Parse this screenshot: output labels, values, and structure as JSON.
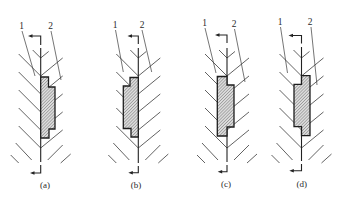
{
  "figures": [
    {
      "id": "a",
      "caption": "(a)",
      "caption_pos": [
        45,
        188
      ],
      "centerline_x": 40.7,
      "centerline_y": [
        48,
        162
      ],
      "labels": [
        {
          "text": "1",
          "x": 21.5,
          "y": 29
        },
        {
          "text": "2",
          "x": 50.5,
          "y": 29
        }
      ],
      "leaders": [
        [
          22,
          31,
          35,
          76
        ],
        [
          51,
          31,
          61,
          80
        ]
      ],
      "shape": [
        [
          40.7,
          77
        ],
        [
          48.5,
          77
        ],
        [
          48.5,
          87
        ],
        [
          55,
          87
        ],
        [
          55,
          129
        ],
        [
          49,
          129
        ],
        [
          49,
          138
        ],
        [
          40.7,
          138
        ]
      ],
      "section_arrow_top": {
        "y": 36,
        "x_tip": 28,
        "y_end": 45
      },
      "section_arrow_bottom": {
        "y": 173,
        "x_tip": 30,
        "y_start": 165
      }
    },
    {
      "id": "b",
      "caption": "(b)",
      "caption_pos": [
        136,
        188
      ],
      "centerline_x": 138.3,
      "centerline_y": [
        48,
        163
      ],
      "labels": [
        {
          "text": "1",
          "x": 115,
          "y": 28
        },
        {
          "text": "2",
          "x": 142,
          "y": 28
        }
      ],
      "leaders": [
        [
          115.5,
          30,
          123.3,
          72
        ],
        [
          142,
          30,
          151.7,
          72
        ]
      ],
      "shape": [
        [
          130,
          77.5
        ],
        [
          138.3,
          77.5
        ],
        [
          138.3,
          137
        ],
        [
          131,
          137
        ],
        [
          131,
          128.5
        ],
        [
          123.3,
          128.5
        ],
        [
          123.3,
          86
        ],
        [
          130,
          86
        ]
      ],
      "section_arrow_top": {
        "y": 36,
        "x_tip": 127.5,
        "y_end": 44
      },
      "section_arrow_bottom": {
        "y": 172.7,
        "x_tip": 128.3,
        "y_start": 166
      }
    },
    {
      "id": "c",
      "caption": "(c)",
      "caption_pos": [
        226,
        187
      ],
      "centerline_x": 227,
      "centerline_y": [
        48,
        162
      ],
      "labels": [
        {
          "text": "1",
          "x": 204.5,
          "y": 26
        },
        {
          "text": "2",
          "x": 234,
          "y": 27
        }
      ],
      "leaders": [
        [
          205,
          28,
          216,
          73
        ],
        [
          234.5,
          29,
          245,
          82
        ]
      ],
      "shape": [
        [
          217.3,
          76.5
        ],
        [
          227,
          76.5
        ],
        [
          227,
          85
        ],
        [
          234,
          85
        ],
        [
          234,
          127
        ],
        [
          227,
          127
        ],
        [
          227,
          136
        ],
        [
          217.3,
          136
        ]
      ],
      "section_arrow_top": {
        "y": 35,
        "x_tip": 215,
        "y_end": 43
      },
      "section_arrow_bottom": {
        "y": 171.7,
        "x_tip": 217.7,
        "y_start": 165
      }
    },
    {
      "id": "d",
      "caption": "(d)",
      "caption_pos": [
        301.7,
        187
      ],
      "centerline_x": 301.5,
      "centerline_y": [
        47,
        161
      ],
      "labels": [
        {
          "text": "1",
          "x": 280,
          "y": 25
        },
        {
          "text": "2",
          "x": 310,
          "y": 25
        }
      ],
      "leaders": [
        [
          280.5,
          27,
          287.5,
          73
        ],
        [
          311,
          27,
          317,
          85
        ]
      ],
      "shape": [
        [
          301.5,
          75.7
        ],
        [
          310,
          75.7
        ],
        [
          310,
          135.7
        ],
        [
          301.5,
          135.7
        ],
        [
          301.5,
          126.7
        ],
        [
          294,
          126.7
        ],
        [
          294,
          84.3
        ],
        [
          301.5,
          84.3
        ]
      ],
      "section_arrow_top": {
        "y": 35.5,
        "x_tip": 288.5,
        "y_end": 43.5
      },
      "section_arrow_bottom": {
        "y": 170.7,
        "x_tip": 289.3,
        "y_start": 164
      }
    }
  ],
  "hatching": {
    "vertices_y": [
      58,
      76,
      94,
      112,
      130,
      148
    ],
    "lengths": [
      8,
      22,
      22,
      22,
      22,
      22
    ],
    "right_rise_ratio": 0.82,
    "extra_strokes_relative": [
      [
        -25,
        143,
        -9,
        160
      ],
      [
        -30,
        155,
        -22,
        163
      ],
      [
        7,
        160,
        22,
        145
      ],
      [
        20,
        163,
        30,
        154
      ]
    ]
  },
  "colors": {
    "line": "#222222",
    "part_fill": "#dcdcdc",
    "part_hatch": "#6e6e6e",
    "background": "#ffffff"
  }
}
